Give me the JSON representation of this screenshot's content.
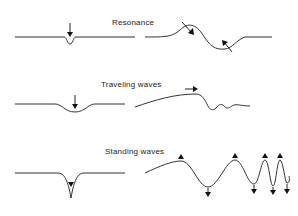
{
  "diagram": {
    "panels": [
      {
        "id": "resonance",
        "title": "Resonance"
      },
      {
        "id": "traveling",
        "title": "Traveling waves"
      },
      {
        "id": "standing",
        "title": "Standing waves"
      }
    ],
    "colors": {
      "stroke": "#333333",
      "background": "#ffffff"
    }
  }
}
